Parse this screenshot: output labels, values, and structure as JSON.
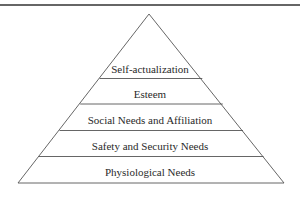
{
  "diagram": {
    "type": "pyramid",
    "title": "",
    "levels_top_to_bottom": [
      {
        "label": "Self-actualization"
      },
      {
        "label": "Esteem"
      },
      {
        "label": "Social Needs and Affiliation"
      },
      {
        "label": "Safety and Security Needs"
      },
      {
        "label": "Physiological Needs"
      }
    ],
    "colors": {
      "line": "#555555",
      "rule": "#333333",
      "text": "#2a2a2a",
      "background": "#ffffff"
    }
  }
}
